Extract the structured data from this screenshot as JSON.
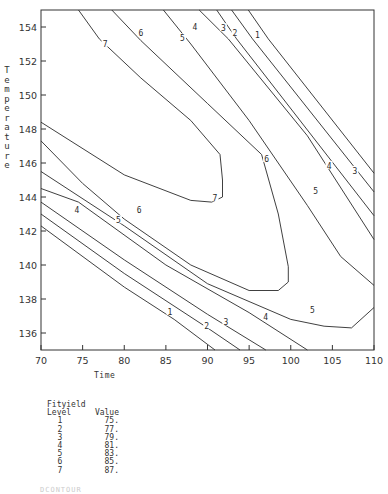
{
  "chart_data": {
    "type": "contour",
    "title": "",
    "xlabel": "Time",
    "ylabel": "Temperature",
    "xlim": [
      70,
      110
    ],
    "ylim": [
      135,
      155
    ],
    "xticks": [
      70,
      75,
      80,
      85,
      90,
      95,
      100,
      105,
      110
    ],
    "yticks": [
      136,
      138,
      140,
      142,
      144,
      146,
      148,
      150,
      152,
      154
    ],
    "grid": false,
    "legend": {
      "title_line1": "Fityield",
      "col_level": "Level",
      "col_value": "Value",
      "entries": [
        {
          "level": "1",
          "value": "75."
        },
        {
          "level": "2",
          "value": "77."
        },
        {
          "level": "3",
          "value": "79."
        },
        {
          "level": "4",
          "value": "81."
        },
        {
          "level": "5",
          "value": "83."
        },
        {
          "level": "6",
          "value": "85."
        },
        {
          "level": "7",
          "value": "87."
        }
      ]
    },
    "contours": [
      {
        "level": 1,
        "value": 75,
        "segments": [
          [
            [
              94.9,
              155
            ],
            [
              97.3,
              153.3
            ],
            [
              110,
              145.4
            ]
          ],
          [
            [
              70,
              142.3
            ],
            [
              80,
              138.7
            ],
            [
              86,
              136.8
            ],
            [
              90.9,
              135
            ]
          ]
        ]
      },
      {
        "level": 2,
        "value": 77,
        "segments": [
          [
            [
              92.9,
              155
            ],
            [
              95.4,
              153.3
            ],
            [
              110,
              144.3
            ]
          ],
          [
            [
              70,
              143.0
            ],
            [
              80,
              139.5
            ],
            [
              90,
              136.3
            ],
            [
              93.9,
              135
            ]
          ]
        ]
      },
      {
        "level": 3,
        "value": 79,
        "segments": [
          [
            [
              91.1,
              155
            ],
            [
              93.5,
              153.3
            ],
            [
              110,
              142.9
            ]
          ],
          [
            [
              70,
              143.7
            ],
            [
              80,
              140.3
            ],
            [
              90,
              137.1
            ],
            [
              97.0,
              135
            ]
          ]
        ]
      },
      {
        "level": 4,
        "value": 81,
        "segments": [
          [
            [
              89.0,
              155
            ],
            [
              92.5,
              153.3
            ],
            [
              102,
              147.6
            ],
            [
              110,
              141.5
            ]
          ],
          [
            [
              70,
              144.5
            ],
            [
              74.5,
              143.7
            ],
            [
              85,
              140.0
            ],
            [
              95,
              137.2
            ],
            [
              102,
              135
            ]
          ]
        ]
      },
      {
        "level": 5,
        "value": 83,
        "segments": [
          [
            [
              84.7,
              155
            ],
            [
              88,
              153.0
            ],
            [
              95,
              148.5
            ],
            [
              102,
              143.5
            ],
            [
              106,
              140.5
            ],
            [
              110,
              138.8
            ]
          ],
          [
            [
              70,
              145.5
            ],
            [
              80,
              142.3
            ],
            [
              90,
              138.9
            ],
            [
              100,
              136.8
            ],
            [
              104,
              136.4
            ],
            [
              107.3,
              136.3
            ],
            [
              110,
              137.5
            ]
          ]
        ]
      },
      {
        "level": 6,
        "value": 85,
        "segments": [
          [
            [
              78.5,
              155
            ],
            [
              82,
              153.2
            ],
            [
              90,
              149.5
            ],
            [
              96.5,
              146.5
            ],
            [
              98.5,
              143
            ],
            [
              99.7,
              139.9
            ],
            [
              99.7,
              139.0
            ],
            [
              98.5,
              138.5
            ],
            [
              95,
              138.5
            ],
            [
              88,
              140.0
            ],
            [
              80,
              142.7
            ],
            [
              75,
              144.8
            ],
            [
              70,
              147.3
            ]
          ]
        ]
      },
      {
        "level": 7,
        "value": 87,
        "segments": [
          [
            [
              74.5,
              155
            ],
            [
              77,
              153.3
            ],
            [
              82,
              151
            ],
            [
              88,
              148.5
            ],
            [
              91.5,
              146.5
            ],
            [
              91.8,
              145
            ],
            [
              91.8,
              144.0
            ],
            [
              90.5,
              143.7
            ],
            [
              88,
              143.8
            ],
            [
              80,
              145.3
            ],
            [
              70,
              148.4
            ]
          ]
        ]
      }
    ],
    "label_positions": [
      {
        "text": "7",
        "x": 77.7,
        "y": 153.0
      },
      {
        "text": "6",
        "x": 82.0,
        "y": 153.6
      },
      {
        "text": "5",
        "x": 87.0,
        "y": 153.3
      },
      {
        "text": "4",
        "x": 88.5,
        "y": 154.0
      },
      {
        "text": "3",
        "x": 91.9,
        "y": 153.9
      },
      {
        "text": "2",
        "x": 93.3,
        "y": 153.6
      },
      {
        "text": "1",
        "x": 96.0,
        "y": 153.5
      },
      {
        "text": "7",
        "x": 90.9,
        "y": 143.9
      },
      {
        "text": "6",
        "x": 97.1,
        "y": 146.2
      },
      {
        "text": "5",
        "x": 103.0,
        "y": 144.3
      },
      {
        "text": "4",
        "x": 104.6,
        "y": 145.8
      },
      {
        "text": "3",
        "x": 107.7,
        "y": 145.5
      },
      {
        "text": "6",
        "x": 81.8,
        "y": 143.2
      },
      {
        "text": "5",
        "x": 79.3,
        "y": 142.6
      },
      {
        "text": "4",
        "x": 74.3,
        "y": 143.2
      },
      {
        "text": "5",
        "x": 102.6,
        "y": 137.3
      },
      {
        "text": "4",
        "x": 97.0,
        "y": 136.9
      },
      {
        "text": "3",
        "x": 92.2,
        "y": 136.6
      },
      {
        "text": "2",
        "x": 89.9,
        "y": 136.4
      },
      {
        "text": "1",
        "x": 85.5,
        "y": 137.2
      }
    ]
  },
  "caption_fragment": "DCONTOUR"
}
